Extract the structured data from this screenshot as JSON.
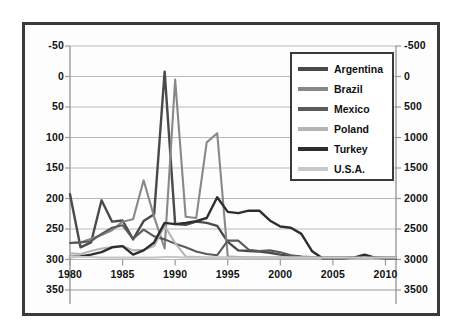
{
  "chart_data": {
    "type": "line",
    "title": "",
    "xlabel": "",
    "ylabel": "",
    "y2label": "",
    "grid": true,
    "legend_position": "top-right",
    "xlim": [
      1980,
      2011
    ],
    "ylim": [
      -50,
      350
    ],
    "y2lim": [
      -500,
      3500
    ],
    "xticks": [
      "1980",
      "1985",
      "1990",
      "1995",
      "2000",
      "2005",
      "2010"
    ],
    "xtick_values": [
      1980,
      1985,
      1990,
      1995,
      2000,
      2005,
      2010
    ],
    "yticks": [
      "-50",
      "0",
      "50",
      "100",
      "150",
      "200",
      "250",
      "300",
      "350"
    ],
    "ytick_values": [
      -50,
      0,
      50,
      100,
      150,
      200,
      250,
      300,
      350
    ],
    "y2ticks": [
      "-500",
      "0",
      "500",
      "1000",
      "1500",
      "2000",
      "2500",
      "3000",
      "3500"
    ],
    "y2tick_values": [
      -500,
      0,
      500,
      1000,
      1500,
      2000,
      2500,
      3000,
      3500
    ],
    "x": [
      1980,
      1981,
      1982,
      1983,
      1984,
      1985,
      1986,
      1987,
      1988,
      1989,
      1990,
      1991,
      1992,
      1993,
      1994,
      1995,
      1996,
      1997,
      1998,
      1999,
      2000,
      2001,
      2002,
      2003,
      2004,
      2005,
      2006,
      2007,
      2008,
      2009,
      2010,
      2011
    ],
    "series": [
      {
        "name": "Argentina",
        "color": "#4a4a4a",
        "values": [
          107,
          20,
          28,
          97,
          62,
          64,
          33,
          63,
          74,
          308,
          58,
          57,
          62,
          60,
          55,
          29,
          15,
          14,
          13,
          11,
          8,
          6,
          4,
          3,
          3,
          3,
          3,
          3,
          3,
          3,
          3,
          3
        ]
      },
      {
        "name": "Brazil",
        "color": "#888888",
        "values": [
          27,
          28,
          34,
          40,
          48,
          62,
          66,
          130,
          70,
          18,
          295,
          70,
          68,
          192,
          207,
          5,
          4,
          3,
          3,
          3,
          3,
          3,
          3,
          3,
          3,
          3,
          3,
          3,
          3,
          3,
          3,
          3
        ]
      },
      {
        "name": "Mexico",
        "color": "#5a5a5a",
        "values": [
          27,
          28,
          30,
          42,
          52,
          56,
          34,
          49,
          38,
          33,
          26,
          20,
          13,
          9,
          7,
          31,
          31,
          16,
          14,
          15,
          12,
          7,
          5,
          4,
          4,
          4,
          4,
          4,
          4,
          4,
          4,
          4
        ]
      },
      {
        "name": "Poland",
        "color": "#b5b5b5",
        "values": [
          10,
          9,
          14,
          18,
          20,
          22,
          15,
          16,
          22,
          55,
          27,
          5,
          4,
          3,
          3,
          3,
          3,
          3,
          3,
          3,
          3,
          3,
          3,
          3,
          3,
          3,
          3,
          3,
          3,
          3,
          3,
          3
        ]
      },
      {
        "name": "Turkey",
        "color": "#2e2e2e",
        "values": [
          4,
          5,
          8,
          12,
          20,
          22,
          8,
          15,
          28,
          60,
          58,
          60,
          63,
          68,
          102,
          78,
          76,
          80,
          80,
          64,
          54,
          52,
          42,
          14,
          2,
          2,
          2,
          3,
          8,
          3,
          2,
          2
        ]
      },
      {
        "name": "U.S.A.",
        "color": "#c8c8c8",
        "values": [
          4,
          4,
          4,
          3,
          3,
          3,
          3,
          3,
          3,
          4,
          4,
          3,
          3,
          3,
          3,
          3,
          3,
          3,
          3,
          3,
          3,
          3,
          3,
          3,
          3,
          3,
          3,
          3,
          3,
          3,
          3,
          3
        ]
      }
    ]
  },
  "axes": {
    "left_ticks": [
      "350",
      "300",
      "250",
      "200",
      "150",
      "100",
      "50",
      "0",
      "-50"
    ],
    "right_ticks": [
      "3500",
      "3000",
      "2500",
      "2000",
      "1500",
      "1000",
      "500",
      "0",
      "-500"
    ],
    "bottom_ticks": [
      "1980",
      "1985",
      "1990",
      "1995",
      "2000",
      "2005",
      "2010"
    ]
  },
  "legend": {
    "items": [
      {
        "label": "Argentina",
        "color": "#4a4a4a"
      },
      {
        "label": "Brazil",
        "color": "#888888"
      },
      {
        "label": "Mexico",
        "color": "#5a5a5a"
      },
      {
        "label": "Poland",
        "color": "#b5b5b5"
      },
      {
        "label": "Turkey",
        "color": "#2e2e2e"
      },
      {
        "label": "U.S.A.",
        "color": "#c8c8c8"
      }
    ]
  }
}
